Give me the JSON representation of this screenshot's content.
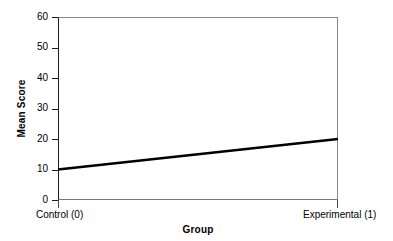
{
  "chart_data": {
    "type": "line",
    "title": "",
    "xlabel": "Group",
    "ylabel": "Mean Score",
    "categories": [
      "Control (0)",
      "Experimental (1)"
    ],
    "x": [
      0,
      1
    ],
    "series": [
      {
        "name": "Mean Score",
        "values": [
          10,
          20
        ],
        "color": "#000000",
        "line_width": 2.6
      }
    ],
    "ylim": [
      0,
      60
    ],
    "yticks": [
      0,
      10,
      20,
      30,
      40,
      50,
      60
    ],
    "ytick_labels": [
      "0",
      "10",
      "20",
      "30",
      "40",
      "50",
      "60"
    ],
    "xlim": [
      0,
      1
    ],
    "xticks": [
      0,
      1
    ],
    "xtick_labels": [
      "Control (0)",
      "Experimental (1)"
    ],
    "grid": false,
    "legend": false,
    "legend_position": "none",
    "frame": {
      "background": "#ffffff",
      "left_axis_color": "#1a1a1a",
      "top_color": "#8a8a8a",
      "right_color": "#8a8a8a",
      "bottom_color": "#777777"
    },
    "annotations": []
  },
  "figure": {
    "background": "#ffffff"
  }
}
